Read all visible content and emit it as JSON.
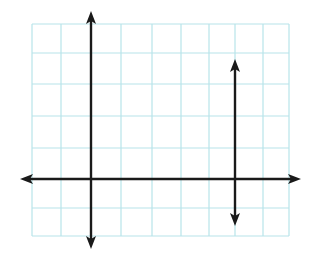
{
  "diagram": {
    "type": "coordinate-grid",
    "colors": {
      "grid": "#b8e4ea",
      "axis": "#1a1a1a",
      "background": "#ffffff"
    },
    "grid": {
      "left": 32,
      "right": 289,
      "top": 24,
      "bottom": 236,
      "vertical_lines_x": [
        32,
        61,
        91,
        121,
        152,
        181,
        209,
        235,
        263,
        289
      ],
      "horizontal_lines_y": [
        24,
        53,
        84,
        116,
        148,
        179,
        208,
        236
      ]
    },
    "lines": [
      {
        "name": "horizontal-axis",
        "x1": 20,
        "y1": 179,
        "x2": 301,
        "y2": 179,
        "arrows": "both"
      },
      {
        "name": "left-vertical-axis",
        "x1": 91,
        "y1": 11,
        "x2": 91,
        "y2": 249,
        "arrows": "both"
      },
      {
        "name": "right-vertical-line",
        "x1": 235,
        "y1": 59,
        "x2": 235,
        "y2": 226,
        "arrows": "both"
      }
    ]
  }
}
